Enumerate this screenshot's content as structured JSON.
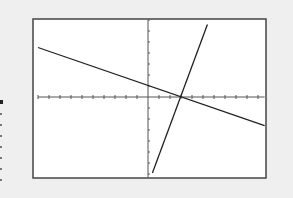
{
  "chart_data": {
    "type": "line",
    "title": "",
    "xlabel": "",
    "ylabel": "",
    "xlim": [
      -10,
      10.6
    ],
    "ylim": [
      -7.3,
      7
    ],
    "grid": false,
    "tick_spacing": 1,
    "legend": null,
    "series": [
      {
        "name": "decreasing-line",
        "x": [
          -10,
          10.6
        ],
        "y": [
          4.5,
          -2.6
        ],
        "y_intercept": 2,
        "x_intercept": 4.5
      },
      {
        "name": "steep-line",
        "x": [
          0.4,
          5.4
        ],
        "y": [
          -6.9,
          6.6
        ],
        "y_intercept": -8,
        "x_intercept": 3
      }
    ],
    "intersection": {
      "x": 3.3,
      "y": 0.9
    }
  },
  "colors": {
    "background": "#efefef",
    "screen": "#ffffff",
    "frame": "#444444",
    "line": "#222222",
    "axis": "#555555"
  }
}
